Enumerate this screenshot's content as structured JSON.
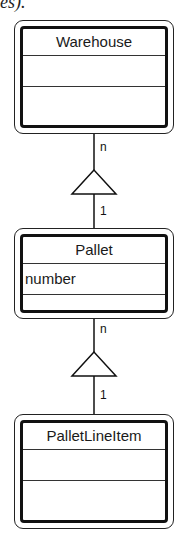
{
  "fragment_text": "es).",
  "classes": [
    {
      "name": "Warehouse",
      "attributes": [],
      "operations": []
    },
    {
      "name": "Pallet",
      "attributes": [
        "number"
      ],
      "operations": []
    },
    {
      "name": "PalletLineItem",
      "attributes": [],
      "operations": []
    }
  ],
  "associations": [
    {
      "from": "Warehouse",
      "to": "Pallet",
      "kind": "aggregation",
      "multiplicity_top": "n",
      "multiplicity_bottom": "1"
    },
    {
      "from": "Pallet",
      "to": "PalletLineItem",
      "kind": "aggregation",
      "multiplicity_top": "n",
      "multiplicity_bottom": "1"
    }
  ],
  "labels": {
    "assoc1_top": "n",
    "assoc1_bottom": "1",
    "assoc2_top": "n",
    "assoc2_bottom": "1"
  },
  "attr_pallet_0": "number"
}
